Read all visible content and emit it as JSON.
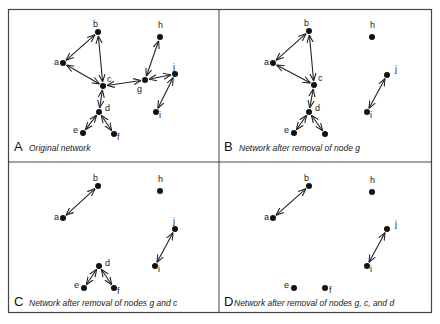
{
  "figure": {
    "panels": [
      {
        "letter": "A",
        "caption": "Original network",
        "offset": [
          0,
          0
        ],
        "nodes": [
          {
            "id": "a",
            "x": 63,
            "y": 63,
            "lx": -9,
            "ly": 2
          },
          {
            "id": "b",
            "x": 98,
            "y": 32,
            "lx": -5,
            "ly": -5
          },
          {
            "id": "c",
            "x": 103,
            "y": 86,
            "lx": 4,
            "ly": -4
          },
          {
            "id": "d",
            "x": 99,
            "y": 112,
            "lx": 6,
            "ly": -1
          },
          {
            "id": "e",
            "x": 83,
            "y": 133,
            "lx": -10,
            "ly": 0
          },
          {
            "id": "f",
            "x": 114,
            "y": 134,
            "lx": 3,
            "ly": 6
          },
          {
            "id": "g",
            "x": 145,
            "y": 80,
            "lx": -8,
            "ly": 12
          },
          {
            "id": "h",
            "x": 160,
            "y": 37,
            "lx": -2,
            "ly": -9
          },
          {
            "id": "i",
            "x": 156,
            "y": 112,
            "lx": 3,
            "ly": 6
          },
          {
            "id": "j",
            "x": 175,
            "y": 74,
            "lx": -2,
            "ly": -4
          }
        ],
        "edges": [
          [
            "a",
            "b"
          ],
          [
            "a",
            "c"
          ],
          [
            "b",
            "c"
          ],
          [
            "c",
            "g"
          ],
          [
            "c",
            "d"
          ],
          [
            "d",
            "e"
          ],
          [
            "d",
            "f"
          ],
          [
            "g",
            "h"
          ],
          [
            "g",
            "j"
          ],
          [
            "j",
            "i"
          ]
        ]
      },
      {
        "letter": "B",
        "caption": "Network after removal of node g",
        "offset": [
          210,
          0
        ],
        "nodes": [
          {
            "id": "a",
            "x": 63,
            "y": 63,
            "lx": -9,
            "ly": 2
          },
          {
            "id": "b",
            "x": 99,
            "y": 31,
            "lx": -5,
            "ly": -5
          },
          {
            "id": "c",
            "x": 104,
            "y": 85,
            "lx": 4,
            "ly": -4
          },
          {
            "id": "d",
            "x": 99,
            "y": 112,
            "lx": 6,
            "ly": -1
          },
          {
            "id": "e",
            "x": 84,
            "y": 133,
            "lx": -10,
            "ly": 0
          },
          {
            "id": "f",
            "x": 115,
            "y": 134,
            "lx": 0,
            "ly": 0,
            "nolabel": true
          },
          {
            "id": "h",
            "x": 162,
            "y": 37,
            "lx": -2,
            "ly": -9
          },
          {
            "id": "i",
            "x": 157,
            "y": 112,
            "lx": 3,
            "ly": 6
          },
          {
            "id": "j",
            "x": 177,
            "y": 75,
            "lx": 8,
            "ly": -3
          }
        ],
        "edges": [
          [
            "a",
            "b"
          ],
          [
            "a",
            "c"
          ],
          [
            "b",
            "c"
          ],
          [
            "c",
            "d"
          ],
          [
            "d",
            "e"
          ],
          [
            "d",
            "f"
          ],
          [
            "j",
            "i"
          ]
        ]
      },
      {
        "letter": "C",
        "caption": "Network after removal of nodes g and c",
        "offset": [
          0,
          155
        ],
        "nodes": [
          {
            "id": "a",
            "x": 63,
            "y": 63,
            "lx": -9,
            "ly": 2
          },
          {
            "id": "b",
            "x": 98,
            "y": 31,
            "lx": -5,
            "ly": -5
          },
          {
            "id": "h",
            "x": 160,
            "y": 36,
            "lx": -2,
            "ly": -9
          },
          {
            "id": "j",
            "x": 175,
            "y": 74,
            "lx": -2,
            "ly": -5
          },
          {
            "id": "i",
            "x": 155,
            "y": 111,
            "lx": 3,
            "ly": 6
          },
          {
            "id": "d",
            "x": 99,
            "y": 111,
            "lx": 6,
            "ly": 0
          },
          {
            "id": "e",
            "x": 84,
            "y": 133,
            "lx": -10,
            "ly": 0
          },
          {
            "id": "f",
            "x": 114,
            "y": 133,
            "lx": 3,
            "ly": 6
          }
        ],
        "edges": [
          [
            "a",
            "b"
          ],
          [
            "d",
            "e"
          ],
          [
            "d",
            "f"
          ],
          [
            "j",
            "i"
          ]
        ]
      },
      {
        "letter": "D",
        "caption": "Network after removal of nodes g, c, and d",
        "offset": [
          210,
          155
        ],
        "nodes": [
          {
            "id": "a",
            "x": 63,
            "y": 63,
            "lx": -9,
            "ly": 2
          },
          {
            "id": "b",
            "x": 99,
            "y": 31,
            "lx": -5,
            "ly": -5
          },
          {
            "id": "h",
            "x": 162,
            "y": 37,
            "lx": -2,
            "ly": -9
          },
          {
            "id": "j",
            "x": 177,
            "y": 74,
            "lx": 8,
            "ly": -2
          },
          {
            "id": "i",
            "x": 157,
            "y": 111,
            "lx": 3,
            "ly": 6
          },
          {
            "id": "e",
            "x": 84,
            "y": 133,
            "lx": -10,
            "ly": 0
          },
          {
            "id": "f",
            "x": 115,
            "y": 133,
            "lx": 4,
            "ly": 5
          }
        ],
        "edges": [
          [
            "a",
            "b"
          ],
          [
            "j",
            "i"
          ]
        ]
      }
    ],
    "colors": {
      "node": "#111111",
      "edge": "#222222",
      "border": "#444444"
    }
  }
}
